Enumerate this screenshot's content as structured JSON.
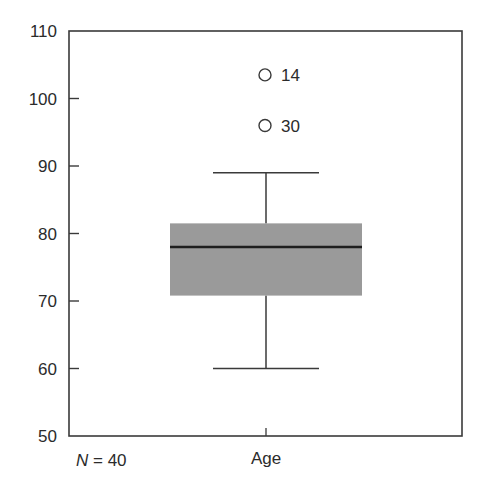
{
  "chart_data": {
    "type": "boxplot",
    "title": "",
    "xlabel": "",
    "ylabel": "",
    "categories": [
      "Age"
    ],
    "ylim": [
      50,
      110
    ],
    "yticks": [
      50,
      60,
      70,
      80,
      90,
      100,
      110
    ],
    "grid": false,
    "legend": null,
    "n_label": {
      "prefix": "N",
      "text": " = 40",
      "value": 40
    },
    "series": [
      {
        "name": "Age",
        "whisker_low": 60,
        "q1": 70.8,
        "median": 78,
        "q3": 81.5,
        "whisker_high": 89,
        "outliers": [
          {
            "case": "14",
            "value": 103.5
          },
          {
            "case": "30",
            "value": 96
          }
        ]
      }
    ]
  },
  "style": {
    "axis_color": "#3a3a3a",
    "box_fill": "#9a9a9a",
    "median_color": "#1e1e1e",
    "whisker_color": "#3a3a3a",
    "outlier_color": "#3a3a3a",
    "text_color": "#2b2b2b"
  }
}
